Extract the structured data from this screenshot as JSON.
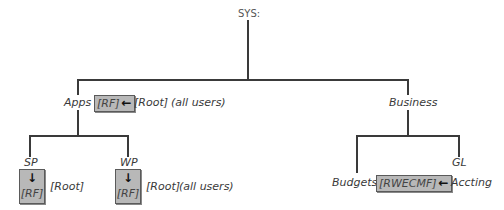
{
  "diagram": {
    "root": {
      "label": "SYS:"
    },
    "apps": {
      "label": "Apps",
      "rights_box": "[RF]",
      "arrow": "←",
      "trustee": "[Root]",
      "note": "(all users)",
      "children": [
        {
          "label": "SP",
          "arrow": "↓",
          "rights_box": "[RF]",
          "trustee": "[Root]"
        },
        {
          "label": "WP",
          "arrow": "↓",
          "rights_box": "[RF]",
          "trustee": "[Root]",
          "note": "(all users)"
        }
      ]
    },
    "business": {
      "label": "Business",
      "children": [
        {
          "label": "Budgets",
          "rights_box": "[RWECMF]",
          "arrow": "←",
          "trustee": "Accting"
        },
        {
          "label": "GL"
        }
      ]
    }
  }
}
